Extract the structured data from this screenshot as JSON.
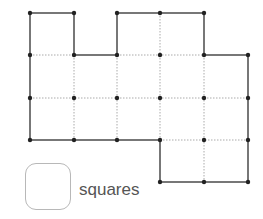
{
  "diagram": {
    "grid": {
      "x": [
        30,
        74,
        117,
        160,
        204,
        248
      ],
      "y": [
        13,
        55,
        98,
        140,
        182
      ]
    },
    "outline": [
      [
        0,
        0
      ],
      [
        1,
        0
      ],
      [
        1,
        1
      ],
      [
        2,
        1
      ],
      [
        2,
        0
      ],
      [
        3,
        0
      ],
      [
        4,
        0
      ],
      [
        4,
        1
      ],
      [
        5,
        1
      ],
      [
        5,
        2
      ],
      [
        5,
        3
      ],
      [
        5,
        4
      ],
      [
        4,
        4
      ],
      [
        3,
        4
      ],
      [
        3,
        3
      ],
      [
        2,
        3
      ],
      [
        1,
        3
      ],
      [
        0,
        3
      ],
      [
        0,
        2
      ],
      [
        0,
        1
      ]
    ],
    "dotted_segments": [
      [
        [
          0,
          1
        ],
        [
          1,
          1
        ]
      ],
      [
        [
          2,
          1
        ],
        [
          4,
          1
        ]
      ],
      [
        [
          0,
          2
        ],
        [
          5,
          2
        ]
      ],
      [
        [
          3,
          3
        ],
        [
          5,
          3
        ]
      ],
      [
        [
          1,
          1
        ],
        [
          1,
          3
        ]
      ],
      [
        [
          2,
          1
        ],
        [
          2,
          3
        ]
      ],
      [
        [
          3,
          0
        ],
        [
          3,
          3
        ]
      ],
      [
        [
          4,
          1
        ],
        [
          4,
          4
        ]
      ]
    ],
    "points": [
      [
        0,
        0
      ],
      [
        1,
        0
      ],
      [
        2,
        0
      ],
      [
        3,
        0
      ],
      [
        4,
        0
      ],
      [
        0,
        1
      ],
      [
        1,
        1
      ],
      [
        2,
        1
      ],
      [
        3,
        1
      ],
      [
        4,
        1
      ],
      [
        5,
        1
      ],
      [
        0,
        2
      ],
      [
        1,
        2
      ],
      [
        2,
        2
      ],
      [
        3,
        2
      ],
      [
        4,
        2
      ],
      [
        5,
        2
      ],
      [
        0,
        3
      ],
      [
        1,
        3
      ],
      [
        2,
        3
      ],
      [
        3,
        3
      ],
      [
        4,
        3
      ],
      [
        5,
        3
      ],
      [
        3,
        4
      ],
      [
        4,
        4
      ],
      [
        5,
        4
      ]
    ],
    "colors": {
      "outline": "#777777",
      "dotted": "#aaaaaa",
      "point": "#222222"
    }
  },
  "legend": {
    "label": "squares",
    "icon": "rounded-square-icon"
  }
}
